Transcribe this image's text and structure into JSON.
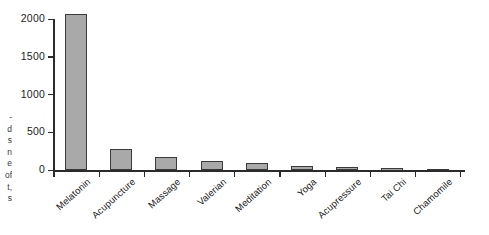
{
  "chart_data": {
    "type": "bar",
    "title": "",
    "subtitle": "",
    "xlabel": "",
    "ylabel": "",
    "categories": [
      "Melatonin",
      "Acupuncture",
      "Massage",
      "Valerian",
      "Meditation",
      "Yoga",
      "Acupressure",
      "Tai Chi",
      "Chamomile"
    ],
    "values": [
      2060,
      280,
      175,
      120,
      95,
      55,
      35,
      30,
      5
    ],
    "series": [
      {
        "name": "Number of publications",
        "values": [
          2060,
          280,
          175,
          120,
          95,
          55,
          35,
          30,
          5
        ]
      }
    ],
    "ylim": [
      0,
      2000
    ],
    "ytick_labels": [
      "0",
      "500",
      "1000",
      "1500",
      "2000"
    ],
    "ytick_values": [
      0,
      500,
      1000,
      1500,
      2000
    ],
    "grid": false,
    "legend": false,
    "legend_position": "none",
    "bar_color": "#a9a9a9",
    "bar_edge_color": "#3a3a3a",
    "axis_color": "#2b2b2b",
    "annotations": []
  },
  "caption_fragments": {
    "lines": [
      "-",
      "d",
      "s",
      "n",
      "e",
      "of",
      "t,",
      "s"
    ]
  }
}
